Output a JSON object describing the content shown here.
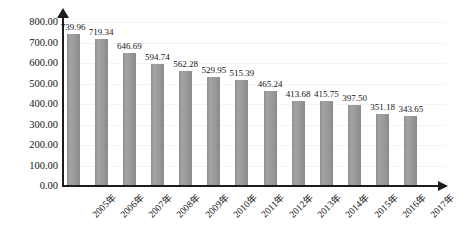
{
  "chart_data": {
    "type": "bar",
    "title": "",
    "subtitle": "",
    "xlabel": "",
    "ylabel": "",
    "ylim": [
      0,
      800
    ],
    "ytick_step": 100,
    "grid": true,
    "legend": "none",
    "bar_color": "#969696",
    "axis_color": "#1c1c1c",
    "gridline_color": "#f4f4f4",
    "categories": [
      "2005年",
      "2006年",
      "2007年",
      "2008年",
      "2009年",
      "2010年",
      "2011年",
      "2012年",
      "2013年",
      "2014年",
      "2015年",
      "2016年",
      "2017年"
    ],
    "values": [
      739.96,
      719.34,
      646.69,
      594.74,
      562.28,
      529.95,
      515.39,
      465.24,
      413.68,
      415.75,
      397.5,
      351.18,
      343.65
    ],
    "data_labels": [
      "739.96",
      "719.34",
      "646.69",
      "594.74",
      "562.28",
      "529.95",
      "515.39",
      "465.24",
      "413.68",
      "415.75",
      "397.50",
      "351.18",
      "343.65"
    ],
    "ytick_labels": [
      "800.00",
      "700.00",
      "600.00",
      "500.00",
      "400.00",
      "300.00",
      "200.00",
      "100.00",
      "0.00"
    ],
    "ytick_values": [
      800,
      700,
      600,
      500,
      400,
      300,
      200,
      100,
      0
    ]
  }
}
